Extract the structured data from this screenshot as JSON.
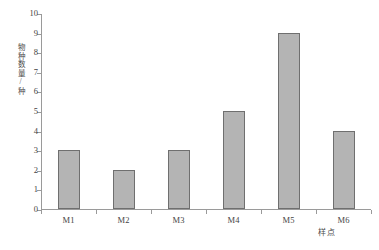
{
  "chart_data": {
    "type": "bar",
    "title": "",
    "subtitle": "",
    "xlabel": "样点",
    "ylabel": "物种数量/种",
    "categories": [
      "M1",
      "M2",
      "M3",
      "M4",
      "M5",
      "M6"
    ],
    "values": [
      3,
      2,
      3,
      5,
      9,
      4
    ],
    "ylim": [
      0,
      10
    ],
    "ytick_labels": [
      "0",
      "1",
      "2",
      "3",
      "4",
      "5",
      "6",
      "7",
      "8",
      "9",
      "10"
    ],
    "ytick_values": [
      0,
      1,
      2,
      3,
      4,
      5,
      6,
      7,
      8,
      9,
      10
    ],
    "ystep": 1,
    "grid": false,
    "legend": false,
    "legend_position": "none",
    "bar_fill_color": "#b4b4b4",
    "bar_border_color": "#6f6f6f",
    "axis_color": "#9a9a9a",
    "text_color": "#444444",
    "background_color": "#ffffff"
  }
}
